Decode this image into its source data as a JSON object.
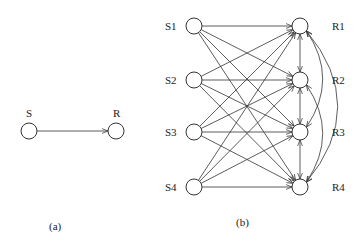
{
  "diagram_a": {
    "caption": "(a)",
    "nodes": [
      {
        "id": "S",
        "label": "S",
        "x": 29,
        "y": 131
      },
      {
        "id": "R",
        "label": "R",
        "x": 116,
        "y": 131
      }
    ],
    "edges": [
      {
        "from": "S",
        "to": "R",
        "directed": true
      }
    ]
  },
  "diagram_b": {
    "caption": "(b)",
    "senders": [
      {
        "id": "S1",
        "label": "S1",
        "x": 194,
        "y": 26
      },
      {
        "id": "S2",
        "label": "S2",
        "x": 194,
        "y": 80
      },
      {
        "id": "S3",
        "label": "S3",
        "x": 194,
        "y": 132
      },
      {
        "id": "S4",
        "label": "S4",
        "x": 194,
        "y": 187
      }
    ],
    "receivers": [
      {
        "id": "R1",
        "label": "R1",
        "x": 300,
        "y": 26
      },
      {
        "id": "R2",
        "label": "R2",
        "x": 300,
        "y": 80
      },
      {
        "id": "R3",
        "label": "R3",
        "x": 300,
        "y": 132
      },
      {
        "id": "R4",
        "label": "R4",
        "x": 300,
        "y": 187
      }
    ],
    "sender_to_receiver": "all-to-all directed",
    "receiver_links": [
      {
        "from": "R1",
        "to": "R2",
        "bidirectional": true
      },
      {
        "from": "R2",
        "to": "R3",
        "bidirectional": true
      },
      {
        "from": "R3",
        "to": "R4",
        "bidirectional": true
      },
      {
        "from": "R1",
        "to": "R3",
        "bidirectional": true,
        "curved": true
      },
      {
        "from": "R2",
        "to": "R4",
        "bidirectional": true,
        "curved": true
      },
      {
        "from": "R1",
        "to": "R4",
        "bidirectional": true,
        "curved": true
      }
    ]
  }
}
